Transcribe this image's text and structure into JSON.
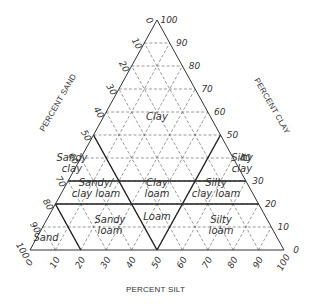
{
  "diagram": {
    "axes": {
      "sand": {
        "title": "PERCENT SAND",
        "ticks": [
          "0",
          "10",
          "20",
          "30",
          "40",
          "50",
          "60",
          "70",
          "80",
          "90",
          "100"
        ]
      },
      "clay": {
        "title": "PERCENT CLAY",
        "ticks": [
          "0",
          "10",
          "20",
          "30",
          "40",
          "50",
          "60",
          "70",
          "80",
          "90",
          "100"
        ]
      },
      "silt": {
        "title": "PERCENT SILT",
        "ticks": [
          "0",
          "10",
          "20",
          "30",
          "40",
          "50",
          "60",
          "70",
          "80",
          "90",
          "100"
        ]
      }
    },
    "regions": [
      {
        "id": "clay",
        "lines": [
          "Clay"
        ]
      },
      {
        "id": "sandy-clay",
        "lines": [
          "Sandy",
          "clay"
        ]
      },
      {
        "id": "silty-clay",
        "lines": [
          "Silty",
          "clay"
        ]
      },
      {
        "id": "sandy-clay-loam",
        "lines": [
          "Sandy/",
          "clay loam"
        ]
      },
      {
        "id": "clay-loam",
        "lines": [
          "Clay",
          "loam"
        ]
      },
      {
        "id": "silty-clay-loam",
        "lines": [
          "Silty",
          "clay loam"
        ]
      },
      {
        "id": "sand",
        "lines": [
          "Sand"
        ]
      },
      {
        "id": "sandy-loam",
        "lines": [
          "Sandy",
          "loam"
        ]
      },
      {
        "id": "loam",
        "lines": [
          "Loam"
        ]
      },
      {
        "id": "silty-loam",
        "lines": [
          "Silty",
          "loam"
        ]
      }
    ]
  }
}
